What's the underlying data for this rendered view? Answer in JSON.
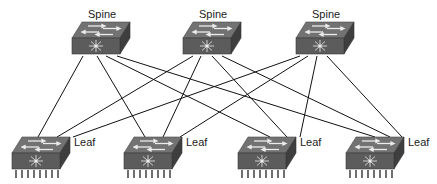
{
  "diagram": {
    "type": "spine-leaf network topology",
    "spines": [
      {
        "id": "spine-1",
        "label": "Spine",
        "x": 72,
        "y": 22
      },
      {
        "id": "spine-2",
        "label": "Spine",
        "x": 183,
        "y": 22
      },
      {
        "id": "spine-3",
        "label": "Spine",
        "x": 296,
        "y": 22
      }
    ],
    "leaves": [
      {
        "id": "leaf-1",
        "label": "Leaf",
        "x": 12,
        "y": 137
      },
      {
        "id": "leaf-2",
        "label": "Leaf",
        "x": 124,
        "y": 137
      },
      {
        "id": "leaf-3",
        "label": "Leaf",
        "x": 238,
        "y": 137
      },
      {
        "id": "leaf-4",
        "label": "Leaf",
        "x": 346,
        "y": 137
      }
    ],
    "links": [
      {
        "from": "spine-1",
        "to": "leaf-1",
        "x1": 83,
        "y1": 56,
        "x2": 38,
        "y2": 137
      },
      {
        "from": "spine-1",
        "to": "leaf-2",
        "x1": 97,
        "y1": 56,
        "x2": 145,
        "y2": 137
      },
      {
        "from": "spine-1",
        "to": "leaf-3",
        "x1": 106,
        "y1": 56,
        "x2": 270,
        "y2": 137
      },
      {
        "from": "spine-1",
        "to": "leaf-4",
        "x1": 117,
        "y1": 56,
        "x2": 375,
        "y2": 137
      },
      {
        "from": "spine-2",
        "to": "leaf-1",
        "x1": 193,
        "y1": 56,
        "x2": 57,
        "y2": 137
      },
      {
        "from": "spine-2",
        "to": "leaf-2",
        "x1": 201,
        "y1": 56,
        "x2": 163,
        "y2": 137
      },
      {
        "from": "spine-2",
        "to": "leaf-3",
        "x1": 212,
        "y1": 56,
        "x2": 287,
        "y2": 137
      },
      {
        "from": "spine-2",
        "to": "leaf-4",
        "x1": 222,
        "y1": 56,
        "x2": 390,
        "y2": 137
      },
      {
        "from": "spine-3",
        "to": "leaf-1",
        "x1": 300,
        "y1": 56,
        "x2": 73,
        "y2": 137
      },
      {
        "from": "spine-3",
        "to": "leaf-2",
        "x1": 308,
        "y1": 56,
        "x2": 180,
        "y2": 137
      },
      {
        "from": "spine-3",
        "to": "leaf-3",
        "x1": 317,
        "y1": 56,
        "x2": 300,
        "y2": 137
      },
      {
        "from": "spine-3",
        "to": "leaf-4",
        "x1": 327,
        "y1": 56,
        "x2": 402,
        "y2": 137
      }
    ],
    "colors": {
      "switch_top": "#6e6e6e",
      "switch_front": "#5a5a5a",
      "switch_side": "#3f3f3f",
      "arrow": "#e6e6e6",
      "link": "#111111",
      "label": "#222222"
    }
  }
}
